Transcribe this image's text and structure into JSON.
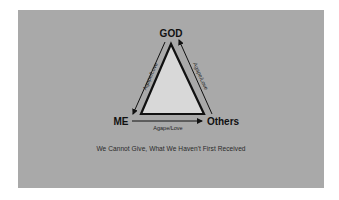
{
  "diagram": {
    "nodes": {
      "top": "GOD",
      "left": "ME",
      "right": "Others"
    },
    "edges": {
      "left_edge_label": "Agape/Love",
      "right_edge_label": "Agape/Love",
      "bottom_edge_label": "Agape/Love"
    },
    "caption": "We Cannot Give, What We Haven't First Received",
    "colors": {
      "background": "#a9a9a9",
      "triangle_fill": "#d8d8d8",
      "stroke": "#111111",
      "text": "#111111"
    }
  }
}
